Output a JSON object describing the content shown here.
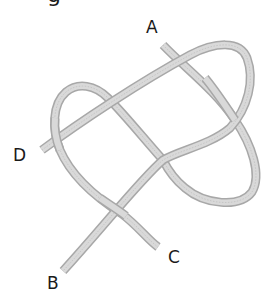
{
  "diagram": {
    "type": "knot-rope-diagram",
    "top_partial_text": "g",
    "labels": {
      "a": "A",
      "b": "B",
      "c": "C",
      "d": "D"
    },
    "colors": {
      "rope_fill": "#d9d9d9",
      "rope_edge": "#a8a8a8",
      "label": "#1a1a1a",
      "background": "#ffffff"
    },
    "rope_ends": [
      "A",
      "B",
      "C",
      "D"
    ]
  }
}
